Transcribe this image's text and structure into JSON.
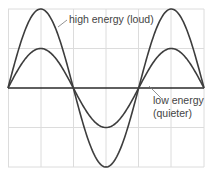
{
  "chart_data": {
    "type": "line",
    "title": "",
    "xlabel": "",
    "ylabel": "",
    "grid": true,
    "series": [
      {
        "name": "high energy (loud)",
        "amplitude": 2,
        "function": "sine",
        "periods": 1.5
      },
      {
        "name": "low energy (quieter)",
        "amplitude": 1,
        "function": "sine",
        "periods": 1.5
      }
    ],
    "ylim": [
      -2,
      2
    ],
    "x": [
      0,
      1,
      2,
      3,
      4,
      5,
      6
    ]
  },
  "labels": {
    "high": "high energy (loud)",
    "low_line1": "low energy",
    "low_line2": "(quieter)"
  },
  "colors": {
    "curve": "#3d3d3d",
    "grid": "#d9d9d9",
    "axis": "#2a2a2a",
    "text": "#444444"
  }
}
